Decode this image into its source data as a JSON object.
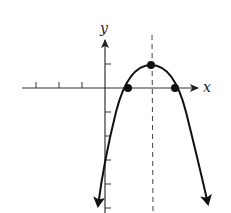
{
  "figure": {
    "type": "parabola-graph",
    "x_axis_label": "x",
    "y_axis_label": "y",
    "equation": "y = -(x - 2)^2 + 1",
    "vertex": {
      "x": 2,
      "y": 1
    },
    "x_intercepts": [
      {
        "x": 1,
        "y": 0
      },
      {
        "x": 3,
        "y": 0
      }
    ],
    "axis_of_symmetry": "x = 2",
    "x_ticks": [
      -3,
      -2,
      -1
    ],
    "y_ticks": [
      1,
      -1,
      -2,
      -3,
      -4,
      -5
    ],
    "colors": {
      "curve": "#111111",
      "axis": "#333333",
      "dashed": "#444444"
    }
  }
}
